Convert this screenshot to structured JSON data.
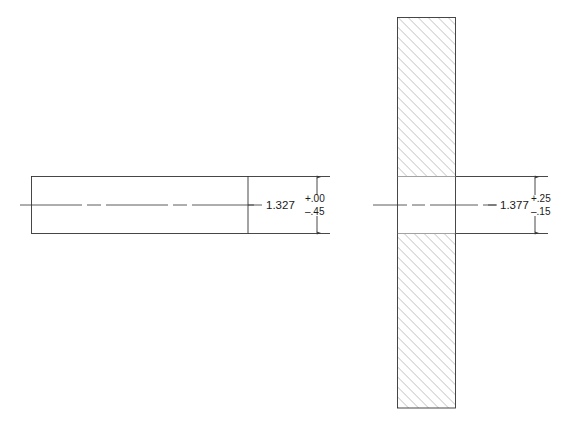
{
  "sheet": {
    "background_color": "#ffffff",
    "line_color": "#333333",
    "hatch_color": "#8c8c8c",
    "text_color": "#1a1a1a",
    "width": 575,
    "height": 424
  },
  "views": [
    {
      "id": "shaft-view",
      "name": "shaft-part-view",
      "geometry": "rectangle",
      "body": {
        "x": 31,
        "y": 176,
        "width": 217,
        "height": 58
      },
      "centerline": {
        "x1": 20,
        "y1": 205,
        "x2": 258,
        "y2": 205
      },
      "dimension": {
        "name": "shaft-height-dimension",
        "nominal": "1.327",
        "tolerance_upper": "+.00",
        "tolerance_lower": "–.45",
        "line_x": 317,
        "arrow_top_y": 177,
        "arrow_bottom_y": 233,
        "value_x": 266,
        "value_y": 209,
        "tol_x": 305,
        "tol_upper_y": 201,
        "tol_lower_y": 214
      },
      "extension_lines": [
        {
          "x1": 248,
          "y1": 176,
          "x2": 330,
          "y2": 176
        },
        {
          "x1": 248,
          "y1": 234,
          "x2": 330,
          "y2": 234
        }
      ]
    },
    {
      "id": "plate-view",
      "name": "plate-with-hole-view",
      "geometry": "sectioned-plate",
      "body": {
        "x": 397,
        "y": 17,
        "width": 59,
        "height": 391
      },
      "hole": {
        "x": 397,
        "y": 176,
        "width": 59,
        "height": 58
      },
      "hatch": {
        "angle_degrees": 45,
        "spacing": 5,
        "stroke_width": 0.7
      },
      "centerline": {
        "x1": 373,
        "y1": 205,
        "x2": 497,
        "y2": 205
      },
      "dimension": {
        "name": "hole-height-dimension",
        "nominal": "1.377",
        "tolerance_upper": "+.25",
        "tolerance_lower": "–.15",
        "line_x": 535,
        "arrow_top_y": 177,
        "arrow_bottom_y": 233,
        "value_x": 500,
        "value_y": 209,
        "tol_x": 531,
        "tol_upper_y": 201,
        "tol_lower_y": 214
      },
      "extension_lines": [
        {
          "x1": 456,
          "y1": 176,
          "x2": 548,
          "y2": 176
        },
        {
          "x1": 456,
          "y1": 234,
          "x2": 548,
          "y2": 234
        }
      ]
    }
  ]
}
